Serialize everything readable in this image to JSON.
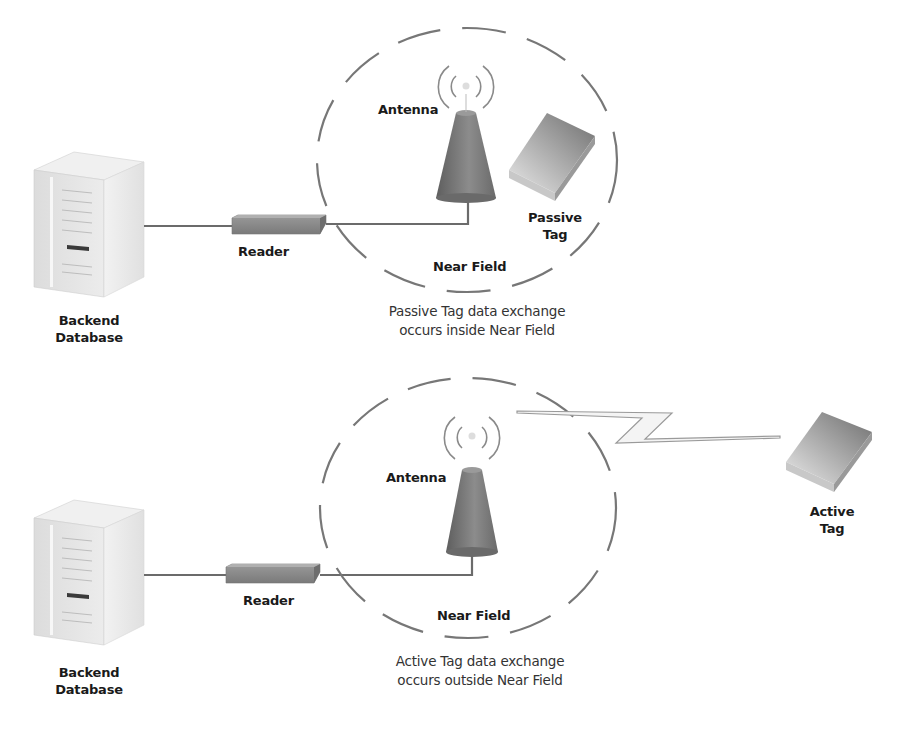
{
  "diagram": {
    "passive": {
      "server_label_line1": "Backend",
      "server_label_line2": "Database",
      "reader_label": "Reader",
      "antenna_label": "Antenna",
      "tag_label_line1": "Passive",
      "tag_label_line2": "Tag",
      "field_label": "Near Field",
      "caption_line1": "Passive Tag data exchange",
      "caption_line2": "occurs inside Near Field"
    },
    "active": {
      "server_label_line1": "Backend",
      "server_label_line2": "Database",
      "reader_label": "Reader",
      "antenna_label": "Antenna",
      "tag_label_line1": "Active",
      "tag_label_line2": "Tag",
      "field_label": "Near Field",
      "caption_line1": "Active Tag data exchange",
      "caption_line2": "occurs outside Near Field"
    },
    "colors": {
      "line": "#6b6b6b",
      "dash": "#777777",
      "server": "#e4e4e4",
      "reader": "#8a8a8a",
      "antenna": "#7a7a7a",
      "tag": "#9a9a9a"
    }
  }
}
